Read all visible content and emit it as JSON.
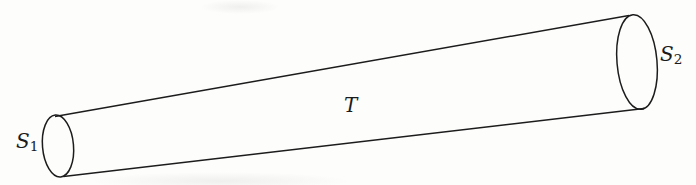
{
  "figure": {
    "tube_label": "T",
    "left_face_label": {
      "base": "S",
      "sub": "1"
    },
    "right_face_label": {
      "base": "S",
      "sub": "2"
    }
  },
  "colors": {
    "ink": "#1c1c1c",
    "paper": "#fdfdfc"
  }
}
